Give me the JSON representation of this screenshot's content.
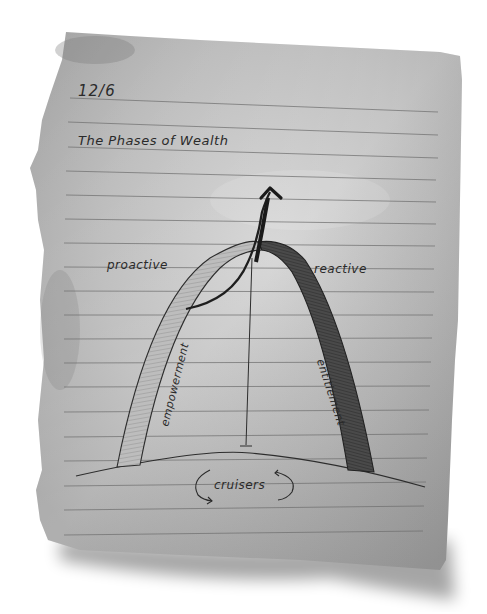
{
  "note": {
    "date": "12/6",
    "title": "The Phases of Wealth",
    "paper_color": "#b9b9b9",
    "ink_color": "#2a2a2a",
    "rule_line_count": 17
  },
  "diagram": {
    "left_side_label": "proactive",
    "right_side_label": "reactive",
    "left_arch_label": "empowerment",
    "right_arch_label": "entitlement",
    "base_label": "cruisers",
    "icons": [
      "upward-arrow-icon",
      "cycle-arrows-icon"
    ]
  }
}
